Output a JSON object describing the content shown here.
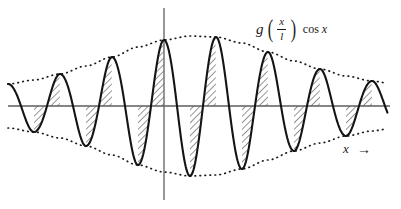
{
  "figure": {
    "title_label": "g(x/l) cos x",
    "function_label": {
      "g": "g",
      "open_paren": "(",
      "numerator": "x",
      "denominator": "l",
      "close_paren": ")",
      "cos": "cos",
      "cos_arg": "x"
    },
    "axis_label": {
      "x": "x",
      "arrow": "→"
    },
    "colors": {
      "curve": "#1a1a1a",
      "axis": "#5a5a5a",
      "envelope": "#1a1a1a",
      "hatch": "#1a1a1a",
      "background": "#ffffff"
    }
  },
  "chart_data": {
    "type": "line",
    "xlabel": "x",
    "ylabel": "",
    "grid": false,
    "legend": "none",
    "axes": {
      "x_axis_y_px": 106,
      "y_axis_x_px": 164,
      "x_range_px": [
        8,
        388
      ],
      "y_axis_top_px": 8,
      "y_axis_bottom_px": 200
    },
    "carrier": {
      "function": "cos x",
      "period_px": 52,
      "peak_positions_px": [
        60,
        112,
        164,
        216,
        268,
        320,
        372
      ],
      "trough_positions_px": [
        34,
        86,
        138,
        190,
        242,
        294,
        346
      ],
      "num_positive_peaks": 7,
      "num_negative_troughs": 7
    },
    "envelope": {
      "function": "g(x/l)",
      "style": "dotted",
      "center_px": 190,
      "peak_amplitude_px": 70,
      "edge_amplitude_px": 26,
      "upper_points_px": [
        [
          8,
          84
        ],
        [
          34,
          80
        ],
        [
          60,
          74
        ],
        [
          86,
          66
        ],
        [
          112,
          57
        ],
        [
          138,
          47
        ],
        [
          164,
          40
        ],
        [
          190,
          36
        ],
        [
          216,
          37
        ],
        [
          242,
          43
        ],
        [
          268,
          52
        ],
        [
          294,
          61
        ],
        [
          320,
          69
        ],
        [
          346,
          76
        ],
        [
          372,
          81
        ],
        [
          388,
          83
        ]
      ],
      "lower_points_px": [
        [
          8,
          128
        ],
        [
          34,
          132
        ],
        [
          60,
          138
        ],
        [
          86,
          146
        ],
        [
          112,
          155
        ],
        [
          138,
          165
        ],
        [
          164,
          172
        ],
        [
          190,
          176
        ],
        [
          216,
          175
        ],
        [
          242,
          169
        ],
        [
          268,
          160
        ],
        [
          294,
          151
        ],
        [
          320,
          143
        ],
        [
          346,
          136
        ],
        [
          372,
          131
        ],
        [
          388,
          129
        ]
      ]
    },
    "hatching": {
      "style": "diagonal-lines",
      "angle_deg": 45,
      "spacing_px": 4,
      "regions": "rising quarter of each positive lobe and falling quarter of each negative lobe"
    },
    "series": [
      {
        "name": "g(x/l) cos x",
        "style": "solid",
        "x": [
          8,
          21,
          34,
          47,
          60,
          73,
          86,
          99,
          112,
          125,
          138,
          151,
          164,
          177,
          190,
          203,
          216,
          229,
          242,
          255,
          268,
          281,
          294,
          307,
          320,
          333,
          346,
          359,
          372,
          385
        ],
        "y_px": [
          106,
          128,
          132,
          106,
          74,
          106,
          146,
          106,
          57,
          106,
          165,
          106,
          40,
          106,
          176,
          106,
          37,
          106,
          169,
          106,
          52,
          106,
          151,
          106,
          69,
          106,
          136,
          106,
          81,
          106
        ]
      },
      {
        "name": "upper envelope +g(x/l)",
        "style": "dotted"
      },
      {
        "name": "lower envelope -g(x/l)",
        "style": "dotted"
      }
    ]
  }
}
